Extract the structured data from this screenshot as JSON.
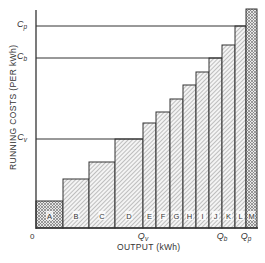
{
  "chart_data": {
    "type": "bar",
    "title": "",
    "xlabel": "OUTPUT (kWh)",
    "ylabel": "RUNNING COSTS (PER kWh)",
    "origin_label": "0",
    "categories": [
      "A",
      "B",
      "C",
      "D",
      "E",
      "F",
      "G",
      "H",
      "I",
      "J",
      "K",
      "L",
      "M"
    ],
    "bars": [
      {
        "label": "A",
        "x0": 36,
        "x1": 63,
        "top": 201,
        "pattern": "cross"
      },
      {
        "label": "B",
        "x0": 63,
        "x1": 89,
        "top": 179,
        "pattern": "diag"
      },
      {
        "label": "C",
        "x0": 89,
        "x1": 115,
        "top": 162,
        "pattern": "diag"
      },
      {
        "label": "D",
        "x0": 115,
        "x1": 143,
        "top": 139,
        "pattern": "diag"
      },
      {
        "label": "E",
        "x0": 143,
        "x1": 156,
        "top": 123,
        "pattern": "diag"
      },
      {
        "label": "F",
        "x0": 156,
        "x1": 170,
        "top": 112,
        "pattern": "diag"
      },
      {
        "label": "G",
        "x0": 170,
        "x1": 183,
        "top": 99,
        "pattern": "diag"
      },
      {
        "label": "H",
        "x0": 183,
        "x1": 196,
        "top": 85,
        "pattern": "diag"
      },
      {
        "label": "I",
        "x0": 196,
        "x1": 209,
        "top": 72,
        "pattern": "diag"
      },
      {
        "label": "J",
        "x0": 209,
        "x1": 222,
        "top": 58,
        "pattern": "diag"
      },
      {
        "label": "K",
        "x0": 222,
        "x1": 235,
        "top": 45,
        "pattern": "diag"
      },
      {
        "label": "L",
        "x0": 235,
        "x1": 246,
        "top": 26,
        "pattern": "diag"
      },
      {
        "label": "M",
        "x0": 246,
        "x1": 257,
        "top": 9,
        "pattern": "cross"
      }
    ],
    "values_relative": [
      1,
      1.8,
      2.4,
      3.2,
      3.8,
      4.2,
      4.7,
      5.2,
      5.6,
      6.1,
      6.6,
      7.3,
      7.9
    ],
    "y_markers": [
      {
        "label": "C_p",
        "y": 26
      },
      {
        "label": "C_b",
        "y": 58
      },
      {
        "label": "C_v",
        "y": 139
      }
    ],
    "x_markers": [
      {
        "label": "Q_v",
        "x": 143
      },
      {
        "label": "Q_b",
        "x": 222
      },
      {
        "label": "Q_p",
        "x": 246
      }
    ],
    "grid": false,
    "legend": "none"
  }
}
